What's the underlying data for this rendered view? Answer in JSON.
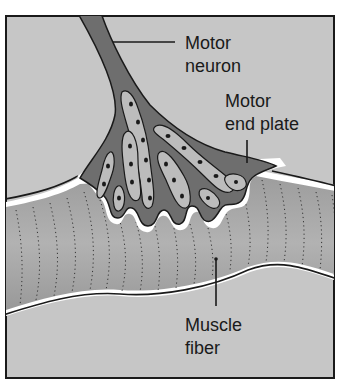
{
  "diagram": {
    "labels": {
      "motor_neuron": {
        "line1": "Motor",
        "line2": "neuron"
      },
      "motor_end_plate": {
        "line1": "Motor",
        "line2": "end plate"
      },
      "muscle_fiber": {
        "line1": "Muscle",
        "line2": "fiber"
      }
    },
    "colors": {
      "background": "#c4c4c4",
      "neuron": "#6e6e6e",
      "neuron_inner": "#8a8a8a",
      "axon_terminals": "#b8b8b8",
      "nuclei": "#1a1a1a",
      "muscle_fiber": "#a2a2a2",
      "muscle_fiber_light": "#b4b4b4",
      "membrane_gap": "#ffffff",
      "outline": "#1a1a1a",
      "frame": "#1a1a1a"
    }
  }
}
